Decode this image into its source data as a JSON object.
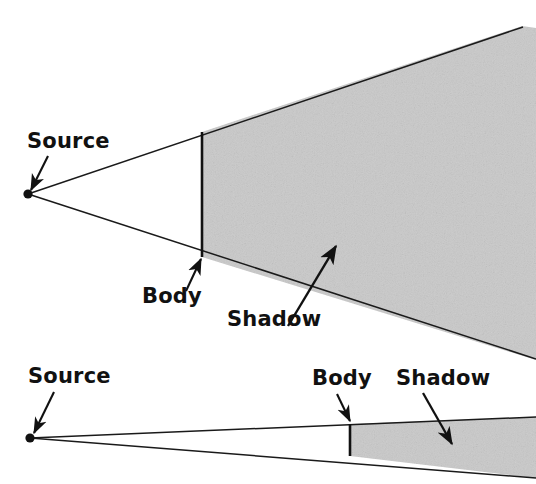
{
  "figure": {
    "name": "umbra-shadow-geometry",
    "background_color": "#ffffff",
    "line_color": "#1a1a1a",
    "shadow_fill": "#c9c9c9",
    "shadow_fill_light": "#d2d2d2",
    "text_color": "#111111"
  },
  "panels": [
    {
      "id": "large-body-panel",
      "source": {
        "label": "Source",
        "label_x": 27,
        "label_y": 148,
        "point_x": 28,
        "point_y": 194,
        "arrow_from_x": 48,
        "arrow_from_y": 156,
        "arrow_to_x": 31,
        "arrow_to_y": 190
      },
      "body": {
        "label": "Body",
        "label_x": 142,
        "label_y": 303,
        "line_x": 202,
        "line_top_y": 132,
        "line_bottom_y": 257,
        "arrow_from_x": 186,
        "arrow_from_y": 291,
        "arrow_to_x": 201,
        "arrow_to_y": 259
      },
      "shadow": {
        "label": "Shadow",
        "label_x": 227,
        "label_y": 326,
        "arrow_from_x": 288,
        "arrow_from_y": 326,
        "arrow_to_x": 336,
        "arrow_to_y": 246,
        "region_points": "202,132 522,26 536,28 536,360 202,257",
        "top_edge": "28,194 523,27",
        "bottom_edge": "28,194 536,359"
      }
    },
    {
      "id": "small-body-panel",
      "source": {
        "label": "Source",
        "label_x": 28,
        "label_y": 383,
        "point_x": 30,
        "point_y": 438,
        "arrow_from_x": 54,
        "arrow_from_y": 392,
        "arrow_to_x": 34,
        "arrow_to_y": 433
      },
      "body": {
        "label": "Body",
        "label_x": 312,
        "label_y": 385,
        "line_x": 350,
        "line_top_y": 424,
        "line_bottom_y": 456,
        "arrow_from_x": 337,
        "arrow_from_y": 394,
        "arrow_to_x": 350,
        "arrow_to_y": 421
      },
      "shadow": {
        "label": "Shadow",
        "label_x": 396,
        "label_y": 385,
        "arrow_from_x": 423,
        "arrow_from_y": 393,
        "arrow_to_x": 452,
        "arrow_to_y": 444,
        "region_points": "350,424 536,417 536,478 350,456",
        "top_edge": "30,438 536,417",
        "bottom_edge": "30,438 536,478"
      }
    }
  ],
  "labels": {
    "source": "Source",
    "body": "Body",
    "shadow": "Shadow"
  }
}
